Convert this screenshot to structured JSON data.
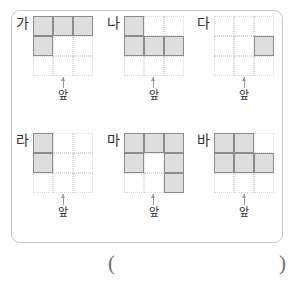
{
  "panel": {
    "grid_size": {
      "rows": 3,
      "cols": 3
    },
    "figures": [
      {
        "label": "가",
        "front_label": "앞",
        "filled_cells": [
          [
            0,
            0
          ],
          [
            0,
            1
          ],
          [
            0,
            2
          ],
          [
            1,
            0
          ]
        ]
      },
      {
        "label": "나",
        "front_label": "앞",
        "filled_cells": [
          [
            0,
            0
          ],
          [
            1,
            0
          ],
          [
            1,
            1
          ],
          [
            1,
            2
          ]
        ]
      },
      {
        "label": "다",
        "front_label": "앞",
        "filled_cells": [
          [
            1,
            2
          ]
        ]
      },
      {
        "label": "라",
        "front_label": "앞",
        "filled_cells": [
          [
            0,
            0
          ],
          [
            1,
            0
          ]
        ]
      },
      {
        "label": "마",
        "front_label": "앞",
        "filled_cells": [
          [
            0,
            0
          ],
          [
            0,
            1
          ],
          [
            0,
            2
          ],
          [
            1,
            0
          ],
          [
            1,
            2
          ],
          [
            2,
            2
          ]
        ]
      },
      {
        "label": "바",
        "front_label": "앞",
        "filled_cells": [
          [
            0,
            0
          ],
          [
            0,
            1
          ],
          [
            1,
            0
          ],
          [
            1,
            1
          ],
          [
            1,
            2
          ]
        ]
      }
    ]
  },
  "answer": {
    "paren_open": "(",
    "paren_close": ")"
  },
  "colors": {
    "cell_fill": "#dedede",
    "cell_border": "#8c8c8c",
    "grid_line": "#d9d9d9",
    "panel_border": "#c9c9c9",
    "text": "#2e2e2e"
  }
}
